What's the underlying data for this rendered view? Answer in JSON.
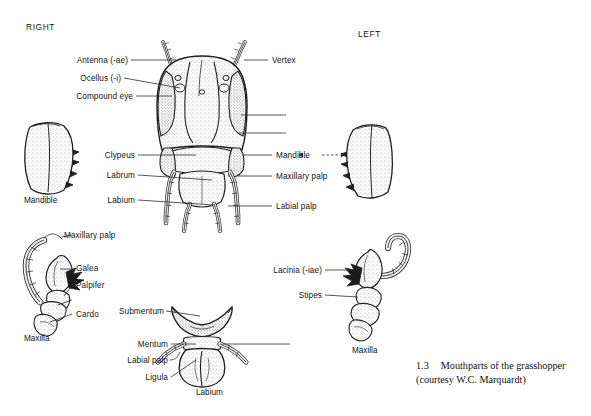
{
  "figure": {
    "title": "Mouthparts of the grasshopper",
    "caption_number": "1.3",
    "caption_line1": "Mouthparts of the grasshopper",
    "caption_line2": "(courtesy W.C. Marquardt)",
    "orientation_headers": {
      "right": "RIGHT",
      "left": "LEFT"
    },
    "stroke_color": "#2b2b2b",
    "ink_color": "#141414",
    "background": "#ffffff"
  },
  "head_diagram": {
    "name": "grasshopper-head-anterior-view",
    "left_labels": [
      {
        "id": "antenna",
        "text": "Antenna (-ae)"
      },
      {
        "id": "ocellus",
        "text": "Ocellus (-i)"
      },
      {
        "id": "compound-eye",
        "text": "Compound eye"
      },
      {
        "id": "clypeus",
        "text": "Clypeus"
      },
      {
        "id": "labrum",
        "text": "Labrum"
      },
      {
        "id": "labium",
        "text": "Labium"
      }
    ],
    "right_labels": [
      {
        "id": "vertex",
        "text": "Vertex"
      },
      {
        "id": "mandible",
        "text": "Mandible"
      },
      {
        "id": "maxillary-palp",
        "text": "Maxillary palp"
      },
      {
        "id": "labial-palp",
        "text": "Labial palp"
      }
    ]
  },
  "mandible_right": {
    "name": "right-mandible",
    "caption": "Mandible"
  },
  "mandible_left": {
    "name": "left-mandible",
    "caption": ""
  },
  "maxilla_left": {
    "name": "left-maxilla-detail",
    "caption": "Maxilla",
    "labels": [
      {
        "id": "maxillary-palp",
        "text": "Maxillary palp"
      },
      {
        "id": "galea",
        "text": "Galea"
      },
      {
        "id": "palpifer",
        "text": "Palpifer"
      },
      {
        "id": "cardo",
        "text": "Cardo"
      }
    ]
  },
  "maxilla_right": {
    "name": "right-maxilla-detail",
    "caption": "Maxilla",
    "labels": [
      {
        "id": "lacinia",
        "text": "Lacinia (-iae)"
      },
      {
        "id": "stipes",
        "text": "Stipes"
      }
    ]
  },
  "labium_diagram": {
    "name": "labium-detail",
    "caption": "Labium",
    "labels": [
      {
        "id": "submentum",
        "text": "Submentum"
      },
      {
        "id": "mentum",
        "text": "Mentum"
      },
      {
        "id": "labial-palp",
        "text": "Labial palp"
      },
      {
        "id": "ligula",
        "text": "Ligula"
      }
    ]
  }
}
